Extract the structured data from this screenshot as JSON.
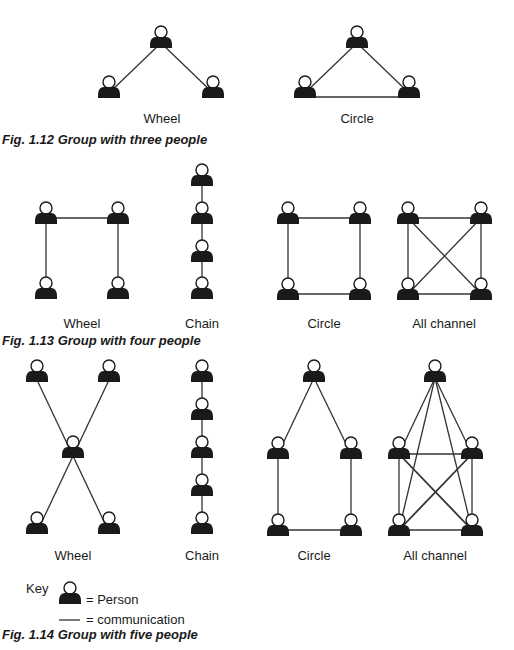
{
  "figures": [
    {
      "caption": "Fig. 1.12  Group with three people",
      "networks": [
        {
          "label": "Wheel",
          "type": "wheel",
          "people": 3
        },
        {
          "label": "Circle",
          "type": "circle",
          "people": 3
        }
      ]
    },
    {
      "caption": "Fig. 1.13  Group with four people",
      "networks": [
        {
          "label": "Wheel",
          "type": "wheel",
          "people": 4
        },
        {
          "label": "Chain",
          "type": "chain",
          "people": 4
        },
        {
          "label": "Circle",
          "type": "circle",
          "people": 4
        },
        {
          "label": "All channel",
          "type": "all-channel",
          "people": 4
        }
      ]
    },
    {
      "caption": "Fig. 1.14  Group with five people",
      "networks": [
        {
          "label": "Wheel",
          "type": "wheel",
          "people": 5
        },
        {
          "label": "Chain",
          "type": "chain",
          "people": 5
        },
        {
          "label": "Circle",
          "type": "circle",
          "people": 5
        },
        {
          "label": "All channel",
          "type": "all-channel",
          "people": 5
        }
      ]
    }
  ],
  "key": {
    "title": "Key",
    "person": "= Person",
    "communication": "= communication"
  },
  "colors": {
    "ink": "#1a1a1a",
    "line": "#333333",
    "background": "#ffffff"
  }
}
